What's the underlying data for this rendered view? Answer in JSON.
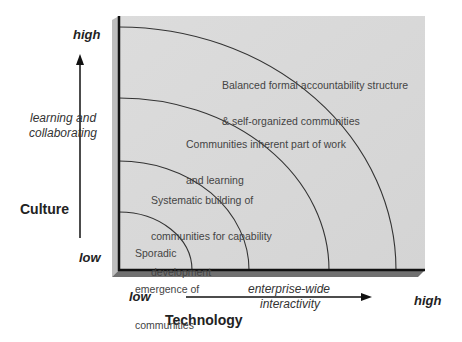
{
  "diagram": {
    "type": "concentric-quadrant-maturity",
    "y_axis": {
      "title": "Culture",
      "dimension": [
        "learning and",
        "collaborating"
      ],
      "high_label": "high",
      "low_label": "low"
    },
    "x_axis": {
      "title": "Technology",
      "dimension": [
        "enterprise-wide",
        "interactivity"
      ],
      "low_label": "low",
      "high_label": "high"
    },
    "levels": [
      {
        "level": 1,
        "text": [
          "Sporadic",
          "emergence of",
          "communities"
        ]
      },
      {
        "level": 2,
        "text": [
          "Systematic building of",
          "communities for capability",
          "development"
        ]
      },
      {
        "level": 3,
        "text": [
          "Communities inherent part of work",
          "and learning"
        ]
      },
      {
        "level": 4,
        "text": [
          "Balanced formal accountability structure",
          "& self-organized communities"
        ]
      }
    ],
    "colors": {
      "panel": "#d9d9d9",
      "panel_left_bevel": "#bdbdbd",
      "panel_bottom_bevel": "#6e6e6e",
      "axis_line": "#111111",
      "arc_line": "#333333",
      "text": "#222222"
    }
  }
}
